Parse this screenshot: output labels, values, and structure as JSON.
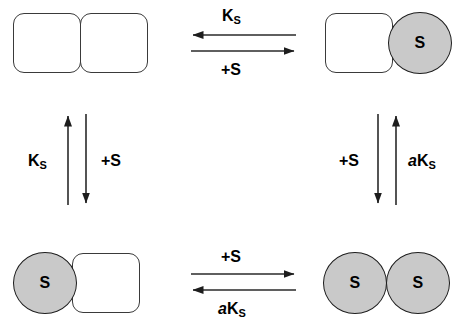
{
  "diagram": {
    "background_color": "#ffffff",
    "stroke_color": "#1d1d1d",
    "square_fill": "#ffffff",
    "square_stroke": "#3a3a3a",
    "circle_fill": "#c9c9c9",
    "circle_stroke": "#1d1d1d",
    "text_color": "#000000"
  },
  "nodes": {
    "top_left": {
      "name": "apo-receptor",
      "subunits": [
        {
          "shape": "rounded-square",
          "state": "empty",
          "label": ""
        },
        {
          "shape": "rounded-square",
          "state": "empty",
          "label": ""
        }
      ]
    },
    "top_right": {
      "name": "receptor-with-right-site-bound",
      "subunits": [
        {
          "shape": "rounded-square",
          "state": "empty",
          "label": ""
        },
        {
          "shape": "circle",
          "state": "bound",
          "label": "S"
        }
      ]
    },
    "bottom_left": {
      "name": "receptor-with-left-site-bound",
      "subunits": [
        {
          "shape": "circle",
          "state": "bound",
          "label": "S"
        },
        {
          "shape": "rounded-square",
          "state": "empty",
          "label": ""
        }
      ]
    },
    "bottom_right": {
      "name": "receptor-fully-bound",
      "subunits": [
        {
          "shape": "circle",
          "state": "bound",
          "label": "S"
        },
        {
          "shape": "circle",
          "state": "bound",
          "label": "S"
        }
      ]
    }
  },
  "edges": {
    "top": {
      "above_label": {
        "base": "K",
        "sub": "S",
        "italic_prefix": ""
      },
      "above_arrow_direction": "left",
      "below_label": {
        "base": "+S",
        "sub": "",
        "italic_prefix": ""
      },
      "below_arrow_direction": "right"
    },
    "bottom": {
      "above_label": {
        "base": "+S",
        "sub": "",
        "italic_prefix": ""
      },
      "above_arrow_direction": "right",
      "below_label": {
        "base": "K",
        "sub": "S",
        "italic_prefix": "a"
      },
      "below_arrow_direction": "left"
    },
    "left": {
      "left_label": {
        "base": "K",
        "sub": "S",
        "italic_prefix": ""
      },
      "left_arrow_direction": "up",
      "right_label": {
        "base": "+S",
        "sub": "",
        "italic_prefix": ""
      },
      "right_arrow_direction": "down"
    },
    "right": {
      "left_label": {
        "base": "+S",
        "sub": "",
        "italic_prefix": ""
      },
      "left_arrow_direction": "down",
      "right_label": {
        "base": "K",
        "sub": "S",
        "italic_prefix": "a"
      },
      "right_arrow_direction": "up"
    }
  }
}
